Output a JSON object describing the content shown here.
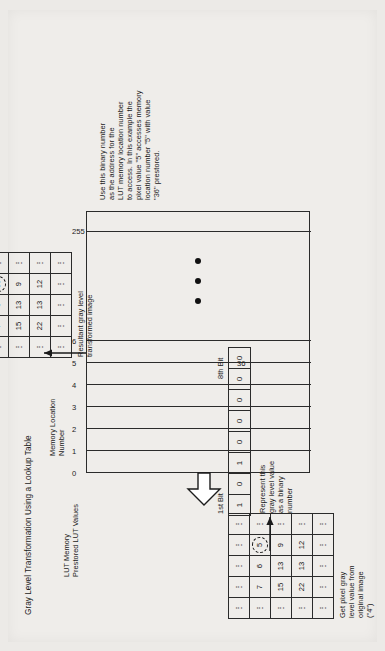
{
  "figure": {
    "title": "Gray Level Transformation Using a Lookup Table",
    "orientation": "rotated-90-ccw"
  },
  "lut": {
    "header_line1": "LUT Memory",
    "header_line2": "Prestored LUT Values",
    "location_header_line1": "Memory Location",
    "location_header_line2": "Number",
    "location_numbers": [
      "0",
      "1",
      "2",
      "3",
      "4",
      "5",
      "6",
      "255"
    ],
    "stored_value_label": "36",
    "stored_value_at_location": "5",
    "ellipsis_dots": 3
  },
  "source_image": {
    "caption_line1": "Get pixel gray",
    "caption_line2": "level value from",
    "caption_line3": "original image",
    "caption_line4": "(\"4\")",
    "rows": [
      [
        "⋮",
        "⋮",
        "⋮",
        "⋮",
        "⋮"
      ],
      [
        "⋮",
        "7",
        "6",
        "5",
        "⋮"
      ],
      [
        "⋮",
        "15",
        "13",
        "9",
        "⋮"
      ],
      [
        "⋮",
        "22",
        "13",
        "12",
        "⋮"
      ],
      [
        "⋮",
        "⋮",
        "⋮",
        "⋮",
        "⋮"
      ]
    ],
    "highlighted_value": "5"
  },
  "binary": {
    "first_bit_label": "1st Bit",
    "eighth_bit_label": "8th Bit",
    "bits": [
      "1",
      "0",
      "1",
      "0",
      "0",
      "0",
      "0",
      "0"
    ],
    "caption_line1": "Represent this",
    "caption_line2": "gray level value",
    "caption_line3": "as a binary",
    "caption_line4": "number"
  },
  "explanation": {
    "line1": "Use this binary number",
    "line2": "as the address for the",
    "line3": "LUT memory location number",
    "line4": "to access. In this example the",
    "line5": "pixel value \"5\" accesses memory",
    "line6": "location number \"5\" with value",
    "line7": "\"36\" prestored."
  },
  "result_image": {
    "caption_line1": "Resultant gray level",
    "caption_line2": "transformed image",
    "rows": [
      [
        "⋮",
        "⋮",
        "⋮",
        "⋮",
        "⋮"
      ],
      [
        "⋮",
        "7",
        "6",
        "36",
        "⋮"
      ],
      [
        "⋮",
        "15",
        "13",
        "9",
        "⋮"
      ],
      [
        "⋮",
        "22",
        "13",
        "12",
        "⋮"
      ],
      [
        "⋮",
        "⋮",
        "⋮",
        "⋮",
        "⋮"
      ]
    ],
    "highlighted_value": "36"
  },
  "colors": {
    "ink": "#1b1b1b",
    "paper": "#efedea",
    "scan_border": "#eceae7"
  }
}
